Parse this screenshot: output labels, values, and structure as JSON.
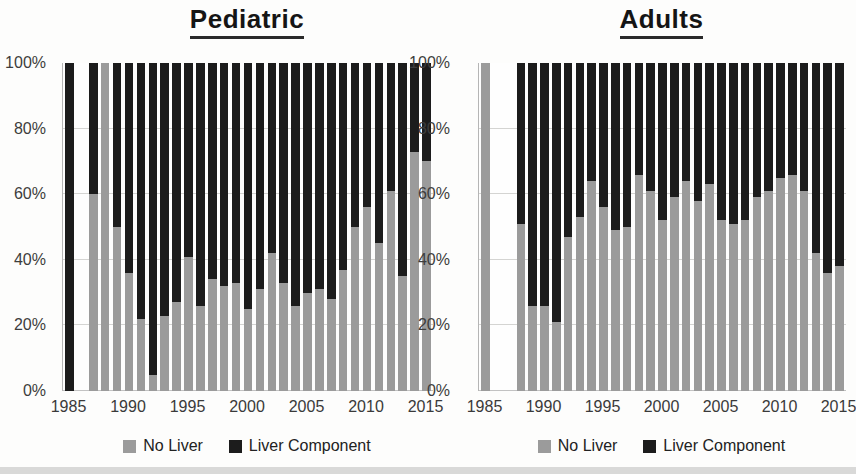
{
  "figure": {
    "left_title": "Pediatric",
    "right_title": "Adults",
    "colors": {
      "no_liver_gray": "#9b9b9b",
      "liver_component_black": "#1c1c1c",
      "gridline": "#d4d4d2",
      "axis_text": "#3d3d3d"
    }
  },
  "chart_data": [
    {
      "type": "bar",
      "stacked": true,
      "title": "Pediatric",
      "x": [
        1985,
        1986,
        1987,
        1988,
        1989,
        1990,
        1991,
        1992,
        1993,
        1994,
        1995,
        1996,
        1997,
        1998,
        1999,
        2000,
        2001,
        2002,
        2003,
        2004,
        2005,
        2006,
        2007,
        2008,
        2009,
        2010,
        2011,
        2012,
        2013,
        2014,
        2015
      ],
      "x_tick_labels": [
        "1985",
        "1990",
        "1995",
        "2000",
        "2005",
        "2010",
        "2015"
      ],
      "y_tick_labels": [
        "100%",
        "80%",
        "60%",
        "40%",
        "20%",
        "0%"
      ],
      "ylim": [
        0,
        100
      ],
      "grid": true,
      "legend_position": "bottom",
      "series": [
        {
          "name": "No Liver",
          "color": "#9b9b9b",
          "values": [
            0,
            null,
            60,
            100,
            50,
            36,
            22,
            5,
            23,
            27,
            41,
            26,
            34,
            32,
            33,
            25,
            31,
            42,
            33,
            26,
            30,
            31,
            28,
            37,
            50,
            56,
            45,
            61,
            35,
            73,
            70
          ]
        },
        {
          "name": "Liver Component",
          "color": "#1c1c1c",
          "values": [
            100,
            null,
            40,
            0,
            50,
            64,
            78,
            95,
            77,
            73,
            59,
            74,
            66,
            68,
            67,
            75,
            69,
            58,
            67,
            74,
            70,
            69,
            72,
            63,
            50,
            44,
            55,
            39,
            65,
            27,
            30
          ]
        }
      ]
    },
    {
      "type": "bar",
      "stacked": true,
      "title": "Adults",
      "x": [
        1985,
        1986,
        1987,
        1988,
        1989,
        1990,
        1991,
        1992,
        1993,
        1994,
        1995,
        1996,
        1997,
        1998,
        1999,
        2000,
        2001,
        2002,
        2003,
        2004,
        2005,
        2006,
        2007,
        2008,
        2009,
        2010,
        2011,
        2012,
        2013,
        2014,
        2015
      ],
      "x_tick_labels": [
        "1985",
        "1990",
        "1995",
        "2000",
        "2005",
        "2010",
        "2015"
      ],
      "y_tick_labels": [
        "100%",
        "80%",
        "60%",
        "40%",
        "20%",
        "0%"
      ],
      "ylim": [
        0,
        100
      ],
      "grid": true,
      "legend_position": "bottom",
      "series": [
        {
          "name": "No Liver",
          "color": "#9b9b9b",
          "values": [
            100,
            null,
            null,
            51,
            26,
            26,
            21,
            47,
            53,
            64,
            56,
            49,
            50,
            66,
            61,
            52,
            59,
            64,
            58,
            63,
            52,
            51,
            52,
            59,
            61,
            65,
            66,
            61,
            42,
            36,
            38
          ]
        },
        {
          "name": "Liver Component",
          "color": "#1c1c1c",
          "values": [
            0,
            null,
            null,
            49,
            74,
            74,
            79,
            53,
            47,
            36,
            44,
            51,
            50,
            34,
            39,
            48,
            41,
            36,
            42,
            37,
            48,
            49,
            48,
            41,
            39,
            35,
            34,
            39,
            58,
            64,
            62
          ]
        }
      ]
    }
  ]
}
